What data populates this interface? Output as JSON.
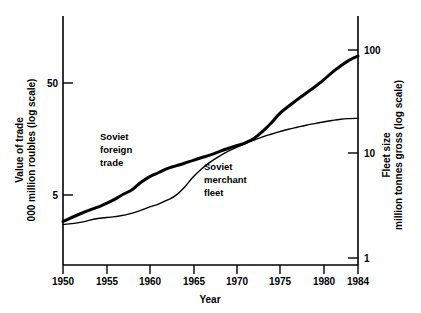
{
  "chart_data": {
    "type": "line",
    "title": "",
    "xlabel": "Year",
    "x_ticks": [
      "1950",
      "1955",
      "1960",
      "1965",
      "1970",
      "1975",
      "1980",
      "1984"
    ],
    "x_tick_values": [
      1950,
      1955,
      1960,
      1965,
      1970,
      1975,
      1980,
      1984
    ],
    "xlim": [
      1950,
      1984
    ],
    "grid": false,
    "legend_position": "inline-annotations",
    "axes": [
      {
        "side": "left",
        "label_line1": "Value of trade",
        "label_line2": "000 million roubles (log scale)",
        "scale": "log",
        "ticks": [
          "50",
          "5"
        ],
        "tick_values": [
          50,
          5
        ],
        "units": "000 million roubles"
      },
      {
        "side": "right",
        "label_line1": "Fleet size",
        "label_line2": "million tonnes gross (log scale)",
        "scale": "log",
        "ticks": [
          "100",
          "10",
          "1"
        ],
        "tick_values": [
          100,
          10,
          1
        ],
        "units": "million tonnes gross"
      }
    ],
    "series": [
      {
        "name": "Soviet foreign trade",
        "annotation_lines": [
          "Soviet",
          "foreign",
          "trade"
        ],
        "axis": "left",
        "units": "000 million roubles",
        "stroke_width": 3,
        "color": "#000000",
        "x": [
          1950,
          1952,
          1954,
          1955,
          1956,
          1957,
          1958,
          1959,
          1960,
          1961,
          1962,
          1963,
          1964,
          1965,
          1966,
          1967,
          1968,
          1969,
          1970,
          1971,
          1972,
          1973,
          1974,
          1975,
          1976,
          1977,
          1978,
          1979,
          1980,
          1981,
          1982,
          1983,
          1984
        ],
        "values": [
          2.9,
          3.4,
          3.9,
          4.2,
          4.6,
          5.1,
          5.6,
          6.5,
          7.3,
          7.9,
          8.6,
          9.1,
          9.6,
          10.2,
          10.8,
          11.4,
          12.2,
          13.0,
          13.8,
          14.6,
          16.0,
          18.5,
          22.0,
          26.8,
          31.0,
          35.5,
          40.5,
          46.0,
          53.0,
          62.0,
          71.0,
          80.0,
          87.0
        ]
      },
      {
        "name": "Soviet merchant fleet",
        "annotation_lines": [
          "Soviet",
          "merchant",
          "fleet"
        ],
        "axis": "right",
        "units": "million tonnes gross",
        "stroke_width": 1.4,
        "color": "#000000",
        "x": [
          1950,
          1952,
          1954,
          1956,
          1958,
          1960,
          1961,
          1962,
          1963,
          1964,
          1965,
          1966,
          1967,
          1968,
          1969,
          1970,
          1971,
          1972,
          1973,
          1974,
          1975,
          1976,
          1977,
          1978,
          1979,
          1980,
          1981,
          1982,
          1983,
          1984
        ],
        "values": [
          2.1,
          2.2,
          2.4,
          2.5,
          2.7,
          3.1,
          3.3,
          3.6,
          4.0,
          4.8,
          6.0,
          7.2,
          8.4,
          9.5,
          10.6,
          11.6,
          12.6,
          13.6,
          14.6,
          15.5,
          16.4,
          17.3,
          18.1,
          18.9,
          19.6,
          20.3,
          21.0,
          21.6,
          21.9,
          22.0
        ]
      }
    ]
  },
  "axis_geometry": {
    "plot_left": 63,
    "plot_right": 358,
    "plot_top": 16,
    "plot_bottom": 265,
    "left_tick_px": {
      "50": 83,
      "5": 195
    },
    "right_tick_px": {
      "100": 50,
      "10": 153,
      "1": 258
    }
  }
}
